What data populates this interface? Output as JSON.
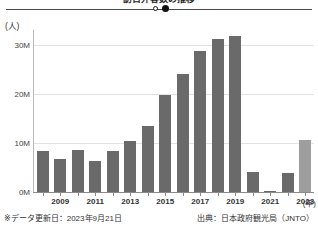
{
  "title": "訪日外客数の推移",
  "slider": {
    "handle_open_name": "slider-handle-open",
    "handle_filled_name": "slider-handle-filled"
  },
  "footer": {
    "left": "※データ更新日：2023年9月21日",
    "right": "出典：日本政府観光局（JNTO）"
  },
  "chart_data": {
    "type": "bar",
    "title": "訪日外客数の推移",
    "xlabel": "(年)",
    "ylabel": "(人)",
    "ylim": [
      0,
      33000000
    ],
    "grid": true,
    "legend": false,
    "y_ticks": [
      "0M",
      "10M",
      "20M",
      "30M"
    ],
    "y_tick_values": [
      0,
      10000000,
      20000000,
      30000000
    ],
    "x_tick_labels": [
      "2009",
      "2011",
      "2013",
      "2015",
      "2017",
      "2019",
      "2021",
      "2023"
    ],
    "categories": [
      "2008",
      "2009",
      "2010",
      "2011",
      "2012",
      "2013",
      "2014",
      "2015",
      "2016",
      "2017",
      "2018",
      "2019",
      "2020",
      "2021",
      "2022",
      "2023"
    ],
    "values": [
      8351000,
      6790000,
      8611000,
      6219000,
      8358000,
      10364000,
      13413000,
      19737000,
      24040000,
      28691000,
      31192000,
      31882000,
      4116000,
      246000,
      3832000,
      10605000
    ],
    "bar_colors": [
      "#6a6a6a",
      "#6a6a6a",
      "#6a6a6a",
      "#6a6a6a",
      "#6a6a6a",
      "#6a6a6a",
      "#6a6a6a",
      "#6a6a6a",
      "#6a6a6a",
      "#6a6a6a",
      "#6a6a6a",
      "#6a6a6a",
      "#6a6a6a",
      "#6a6a6a",
      "#6a6a6a",
      "#9e9e9e"
    ],
    "colors": {
      "bar_default": "#6a6a6a",
      "bar_partial": "#9e9e9e",
      "gridline": "#e2e2e2",
      "axis": "#8a8a8a",
      "text": "#333333"
    }
  }
}
